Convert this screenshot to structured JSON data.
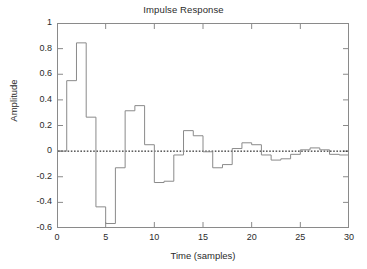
{
  "chart_data": {
    "type": "line",
    "subtype": "stairstep",
    "title": "Impulse Response",
    "xlabel": "Time (samples)",
    "ylabel": "Amplitude",
    "xlim": [
      0,
      30
    ],
    "ylim": [
      -0.6,
      1
    ],
    "xticks": [
      0,
      5,
      10,
      15,
      20,
      25,
      30
    ],
    "xtick_labels": [
      "0",
      "5",
      "10",
      "15",
      "20",
      "25",
      "30"
    ],
    "yticks": [
      -0.6,
      -0.4,
      -0.2,
      0,
      0.2,
      0.4,
      0.6,
      0.8,
      1
    ],
    "ytick_labels": [
      "-0.6",
      "-0.4",
      "-0.2",
      "0",
      "0.2",
      "0.4",
      "0.6",
      "0.8",
      "1"
    ],
    "grid": false,
    "legend": null,
    "zero_line": {
      "value": 0,
      "style": "dotted",
      "color": "#000000"
    },
    "line_color": "#808080",
    "x": [
      0,
      1,
      2,
      3,
      4,
      5,
      6,
      7,
      8,
      9,
      10,
      11,
      12,
      13,
      14,
      15,
      16,
      17,
      18,
      19,
      20,
      21,
      22,
      23,
      24,
      25,
      26,
      27,
      28,
      29
    ],
    "values": [
      0,
      0.55,
      0.845,
      0.265,
      -0.435,
      -0.565,
      -0.13,
      0.315,
      0.355,
      0.05,
      -0.245,
      -0.235,
      -0.03,
      0.16,
      0.12,
      -0.005,
      -0.13,
      -0.105,
      0.02,
      0.065,
      0.05,
      -0.03,
      -0.07,
      -0.06,
      -0.025,
      0.01,
      0.025,
      0.01,
      -0.025,
      -0.03
    ]
  }
}
